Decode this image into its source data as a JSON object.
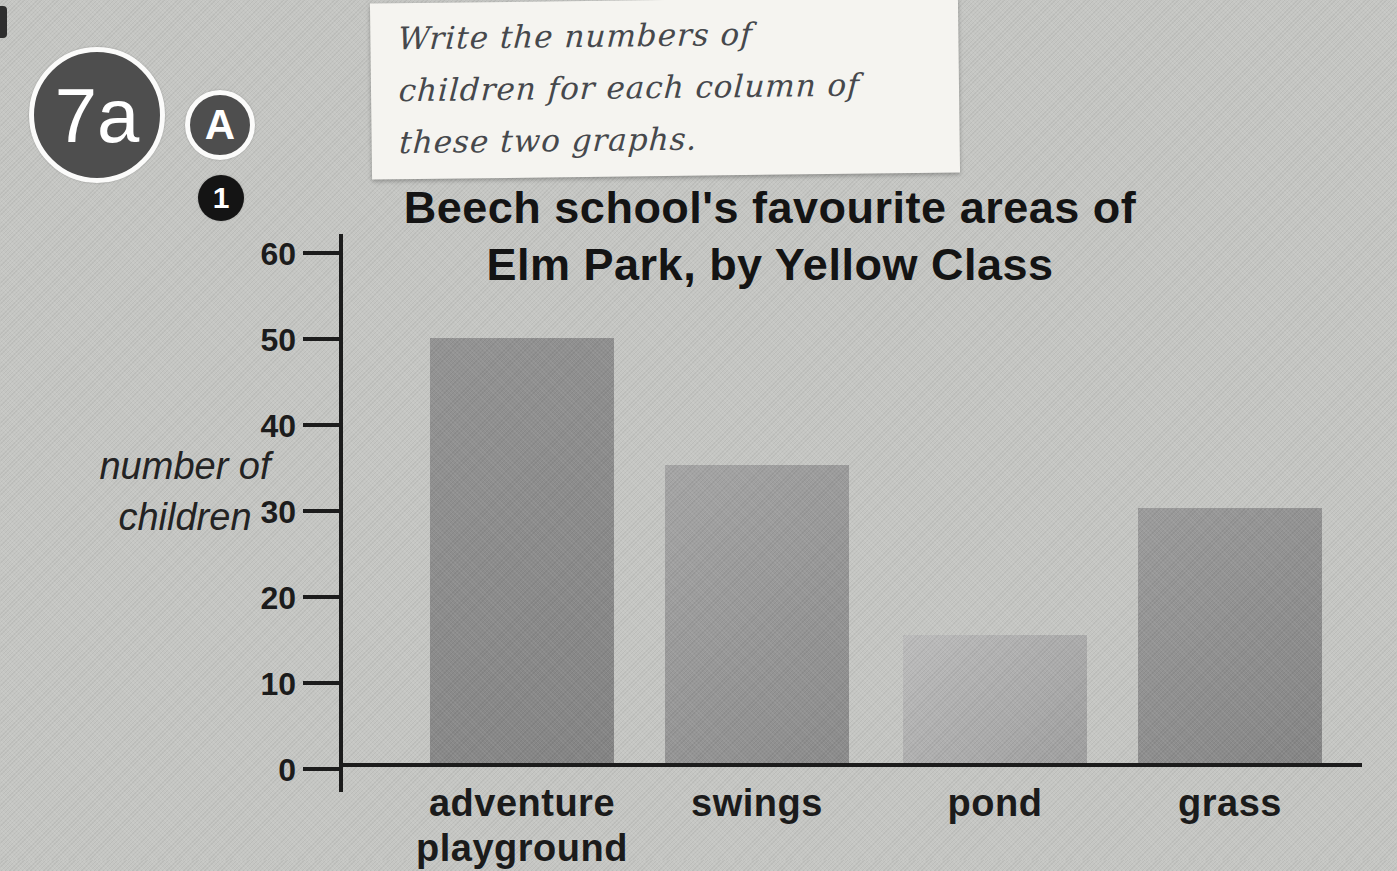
{
  "page": {
    "lesson_badge": "7a",
    "section_badge": "A",
    "question_badge": "1"
  },
  "handwritten_note": {
    "text": "Write the numbers of children for each column of these two graphs.",
    "lines": [
      "Write the numbers of",
      "children for each column of",
      "these two graphs."
    ]
  },
  "chart_data": {
    "type": "bar",
    "title": "Beech school's favourite areas of Elm Park, by Yellow Class",
    "title_lines": [
      "Beech school's favourite areas of",
      "Elm Park, by Yellow Class"
    ],
    "ylabel": "number of children",
    "ylabel_lines": [
      "number of",
      "children"
    ],
    "xlabel": "",
    "categories": [
      "adventure playground",
      "swings",
      "pond",
      "grass"
    ],
    "categories_lines": [
      [
        "adventure",
        "playground"
      ],
      [
        "swings"
      ],
      [
        "pond"
      ],
      [
        "grass"
      ]
    ],
    "values": [
      50,
      35,
      15,
      30
    ],
    "y_ticks": [
      60,
      50,
      40,
      30,
      20,
      10,
      0
    ],
    "ylim": [
      0,
      60
    ],
    "grid": false,
    "legend": false,
    "axis_color": "#1c1c1c",
    "background_color": "#c5c6c3",
    "bar_colors": [
      {
        "light": "#949494",
        "dark": "#848484"
      },
      {
        "light": "#a6a6a6",
        "dark": "#8b8b8b"
      },
      {
        "light": "#bdbdbd",
        "dark": "#9f9f9f"
      },
      {
        "light": "#9c9c9c",
        "dark": "#858585"
      }
    ]
  }
}
